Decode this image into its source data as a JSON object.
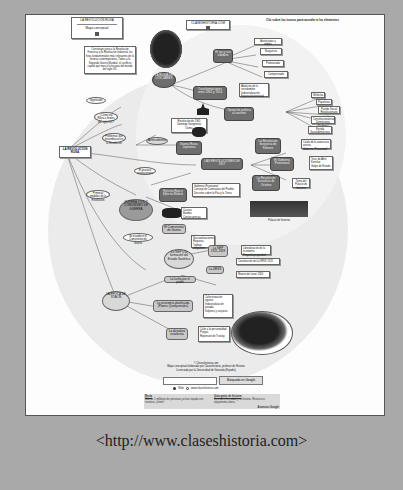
{
  "page": {
    "caption": "<http://www.claseshistoria.com>"
  },
  "map": {
    "instruction": "Clic sobre los iconos para acceder a los elementos",
    "site_label": "CLASESHISTORIA.COM",
    "title_box": {
      "title": "LA REVOLUCIÓN RUSA",
      "subtitle": "Mapa conceptual"
    },
    "intro_text": "Constituye junto a la Revolución Francesa y la Revolución Industrial, los hitos fundamentales más relevantes de la historia contemporánea. Todos a la Segunda Guerra Mundial, el conflicto capital que marcó la historia del mundo del siglo XX.",
    "root": "LA REVOLUCIÓN RUSA",
    "nodes": {
      "tsarist_russia": "LA RUSIA DE LOS ZARES",
      "social_classes": "El zar y sus súbditos",
      "social_items": [
        "Aristócratas y nobles",
        "Burguesía",
        "Proletariado",
        "Campesinado"
      ],
      "transformations": "Transformaciones entre 1861 y 1914",
      "transformations_items": [
        "Abolición de la servidumbre",
        "Industrialización",
        "Expansión territorial"
      ],
      "political_opposition": "Oposición política al zarismo",
      "opposition_items": [
        "Nihilistas",
        "Populistas",
        "Partido Social Revolucionario",
        "Constitucionalistas Demócratas (Kadetes)",
        "Partido Socialdemócrata"
      ],
      "parties_items": [
        "Mencheviques",
        "Bolcheviques"
      ],
      "background": "Antecedentes",
      "war_1905": "Guerra Ruso-Japonesa",
      "revolution_1905": "Revolución de 1905",
      "revolution_1905_items": [
        "Domingo Sangriento",
        "Soviets",
        "Manifiesto de Octubre",
        "Duma"
      ],
      "revolutions_1917": "LAS REVOLUCIONES DE 1917",
      "february": "La Revolución burguesa de Febrero",
      "february_items": [
        "Caída de la autocracia zarista",
        "Gobierno Provisional"
      ],
      "dual_power": "El Gobierno Provisional",
      "dual_power_items": [
        "Tesis de Abril",
        "Kornilov",
        "Golpe de Estado"
      ],
      "october": "La Revolución Socialista de Octubre",
      "october_items": [
        "Toma del Palacio de Invierno",
        "Decretos"
      ],
      "winter_palace": "Palacio de Invierno",
      "provisional_items": [
        "Gobierno Provisional",
        "Consejo de Comisarios del Pueblo",
        "Decretos sobre la Paz y la Tierra",
        "Asamblea Constituyente"
      ],
      "civil_war": "GUERRA CIVIL Y COMUNISMO DE GUERRA",
      "civil_war_sides": "Ejército Rojo y Ejército Blanco",
      "civil_war_items": [
        "Causas",
        "Bandos",
        "Consecuencias"
      ],
      "war_communism": "El Comunismo de Guerra",
      "war_communism_items": [
        "Nacionalizaciones",
        "Requisas",
        "Trabajo obligatorio"
      ],
      "nep": "La NEP y la formación del Estado Soviético",
      "nep_years": "La NEP 1921-1928",
      "nep_items": [
        "Liberalización de la economía",
        "Pequeña propiedad"
      ],
      "ussr": "La URSS",
      "ussr_items": [
        "Constitución de la URSS 1922",
        "Muerte de Lenin 1924",
        "Lucha por el poder"
      ],
      "power_struggle": "La lucha por el poder",
      "stalin_era": "LA ÉPOCA DE STALIN",
      "planned_economy": "La economía planificada (Planes Quinquenales)",
      "planned_items": [
        "Colectivización agraria",
        "Industrialización pesada",
        "Koljoses y sovjoses"
      ],
      "dictatorship": "La dictadura estalinista",
      "dictatorship_items": [
        "Culto a la personalidad",
        "Purgas",
        "Gulag",
        "Represión de Trotsky"
      ],
      "edges": [
        "Significado",
        "¿Cómo era Rusia a finales del siglo XIX?",
        "Problemas que desembocan en la Revolución",
        "El proceso revolucionario",
        "Primeras medidas de la Revolución",
        "Se establece el Comunismo de Guerra"
      ]
    }
  },
  "footer": {
    "credits_line1": "© Claseshistoria.com",
    "credits_line2": "Mapa conceptual elaborado por Claseshistoria, profesor de Historia",
    "credits_line3": "Licenciado por la Universidad de Granada (España)",
    "search_button": "Búsqueda en Google",
    "radio_web": "Web",
    "radio_site": "www.claseshistoria.com",
    "ads": {
      "left_title": "Rusia",
      "left_text": "Más de 1 millones de personas ya han viajado con nosotros ¡Únete!",
      "right_title": "Guía gratis de historia",
      "right_text": "Descubre la ciudad y su historia. Reserva tu alojamiento ahora.",
      "google_label": "Anuncios Google"
    },
    "navigation_text": "Otros mapas conceptuales de Claseshistoria",
    "badge_1": "CC",
    "badge_2": "BY-NC-SA"
  }
}
